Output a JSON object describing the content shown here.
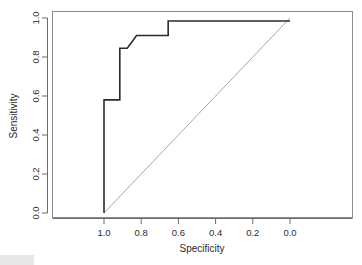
{
  "figure": {
    "kind": "roc-curve-plot",
    "background_color": "#ffffff",
    "box_border_color": "#8c8c8c",
    "curve_color": "#2b2b2b",
    "reference_line_color": "#a6a6a6"
  },
  "chart_data": {
    "type": "line",
    "title": "",
    "subtitle": "",
    "xlabel": "Specificity",
    "ylabel": "Sensitivity",
    "xlim": [
      1.0,
      0.0
    ],
    "ylim": [
      0.0,
      1.0
    ],
    "x_reversed": true,
    "grid": false,
    "legend": null,
    "legend_position": "none",
    "xticks": [
      "1.0",
      "0.8",
      "0.6",
      "0.4",
      "0.2",
      "0.0"
    ],
    "xtick_values": [
      1.0,
      0.8,
      0.6,
      0.4,
      0.2,
      0.0
    ],
    "yticks": [
      "0.0",
      "0.2",
      "0.4",
      "0.6",
      "0.8",
      "1.0"
    ],
    "ytick_values": [
      0.0,
      0.2,
      0.4,
      0.6,
      0.8,
      1.0
    ],
    "series": [
      {
        "name": "ROC curve",
        "style": "step",
        "color": "#2b2b2b",
        "x": [
          1.0,
          1.0,
          0.915,
          0.915,
          0.875,
          0.875,
          0.825,
          0.825,
          0.655,
          0.655,
          0.0
        ],
        "y": [
          0.0,
          0.58,
          0.58,
          0.845,
          0.845,
          0.845,
          0.91,
          0.91,
          0.91,
          0.985,
          0.985
        ]
      },
      {
        "name": "Chance reference line",
        "style": "diagonal",
        "color": "#a6a6a6",
        "x": [
          1.0,
          0.0
        ],
        "y": [
          0.0,
          1.0
        ]
      }
    ],
    "annotations": []
  },
  "axes": {
    "x_title": "Specificity",
    "y_title": "Sensitivity"
  }
}
